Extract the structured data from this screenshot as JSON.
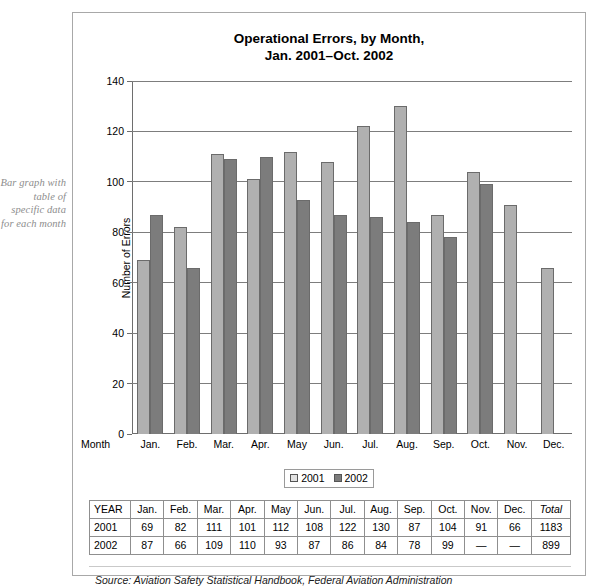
{
  "margin_note": "Bar graph with table of specific data for each month",
  "chart_data": {
    "type": "bar",
    "title": "Operational Errors, by Month, Jan. 2001–Oct. 2002",
    "title_lines": [
      "Operational Errors, by Month,",
      "Jan. 2001–Oct. 2002"
    ],
    "xlabel": "Month",
    "ylabel": "Number of Errors",
    "ylim": [
      0,
      140
    ],
    "ytick_step": 20,
    "yticks": [
      0,
      20,
      40,
      60,
      80,
      100,
      120,
      140
    ],
    "grid": true,
    "legend_position": "bottom-center",
    "categories": [
      "Jan.",
      "Feb.",
      "Mar.",
      "Apr.",
      "May",
      "Jun.",
      "Jul.",
      "Aug.",
      "Sep.",
      "Oct.",
      "Nov.",
      "Dec."
    ],
    "series": [
      {
        "name": "2001",
        "color": "#b0b0b0",
        "values": [
          69,
          82,
          111,
          101,
          112,
          108,
          122,
          130,
          87,
          104,
          91,
          66
        ]
      },
      {
        "name": "2002",
        "color": "#7c7c7c",
        "values": [
          87,
          66,
          109,
          110,
          93,
          87,
          86,
          84,
          78,
          99,
          null,
          null
        ]
      }
    ],
    "source": "Source: Aviation Safety Statistical Handbook, Federal Aviation Administration"
  },
  "table": {
    "headers": [
      "YEAR",
      "Jan.",
      "Feb.",
      "Mar.",
      "Apr.",
      "May",
      "Jun.",
      "Jul.",
      "Aug.",
      "Sep.",
      "Oct.",
      "Nov.",
      "Dec.",
      "Total"
    ],
    "rows": [
      [
        "2001",
        "69",
        "82",
        "111",
        "101",
        "112",
        "108",
        "122",
        "130",
        "87",
        "104",
        "91",
        "66",
        "1183"
      ],
      [
        "2002",
        "87",
        "66",
        "109",
        "110",
        "93",
        "87",
        "86",
        "84",
        "78",
        "99",
        "—",
        "—",
        "899"
      ]
    ]
  }
}
